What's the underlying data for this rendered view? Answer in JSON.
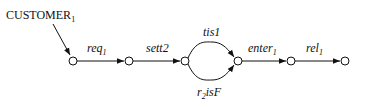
{
  "diagram": {
    "type": "state-transition",
    "source_label": {
      "text": "CUSTOMER",
      "subscript": "1"
    },
    "nodes": [
      {
        "id": "n1",
        "x": 73,
        "y": 61
      },
      {
        "id": "n2",
        "x": 129,
        "y": 61
      },
      {
        "id": "n3",
        "x": 185,
        "y": 61
      },
      {
        "id": "n4",
        "x": 238,
        "y": 61
      },
      {
        "id": "n5",
        "x": 291,
        "y": 61
      },
      {
        "id": "n6",
        "x": 345,
        "y": 61
      }
    ],
    "edges": [
      {
        "from": "n1",
        "to": "n2",
        "label": "req",
        "subscript": "1"
      },
      {
        "from": "n2",
        "to": "n3",
        "label": "sett2",
        "subscript": ""
      },
      {
        "from": "n3",
        "to": "n4",
        "label": "tis1",
        "subscript": "",
        "curve": "upper"
      },
      {
        "from": "n3",
        "to": "n4",
        "label_prefix": "r",
        "subscript": "2",
        "label": "isF",
        "curve": "lower"
      },
      {
        "from": "n4",
        "to": "n5",
        "label": "enter",
        "subscript": "1"
      },
      {
        "from": "n5",
        "to": "n6",
        "label": "rel",
        "subscript": "1"
      }
    ]
  }
}
